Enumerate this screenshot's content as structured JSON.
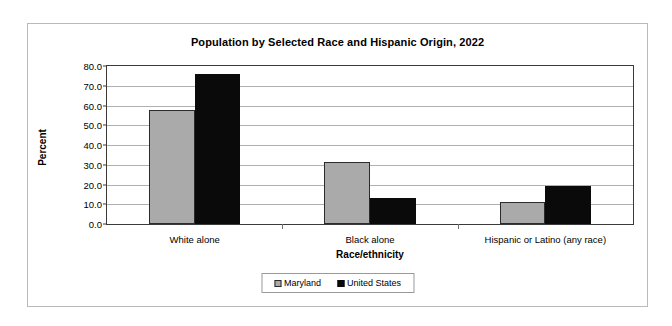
{
  "chart_data": {
    "type": "bar",
    "title": "Population by Selected Race and Hispanic Origin, 2022",
    "xlabel": "Race/ethnicity",
    "ylabel": "Percent",
    "categories": [
      "White alone",
      "Black alone",
      "Hispanic or Latino (any race)"
    ],
    "series": [
      {
        "name": "Maryland",
        "color": "#aaaaaa",
        "values": [
          57.5,
          31.2,
          11.3
        ]
      },
      {
        "name": "United States",
        "color": "#0a0a0a",
        "values": [
          75.8,
          13.3,
          19.1
        ]
      }
    ],
    "ylim": [
      0.0,
      80.0
    ],
    "ytick_step": 10.0,
    "ytick_labels": [
      "0.0",
      "10.0",
      "20.0",
      "30.0",
      "40.0",
      "50.0",
      "60.0",
      "70.0",
      "80.0"
    ],
    "grid": true,
    "legend_position": "bottom"
  }
}
